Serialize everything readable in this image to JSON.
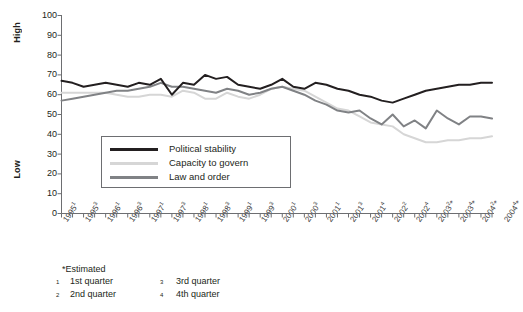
{
  "chart_data": {
    "type": "line",
    "title": "",
    "xlabel": "",
    "ylabel": "",
    "ylim": [
      0,
      100
    ],
    "ytick_values": [
      0,
      10,
      20,
      30,
      40,
      50,
      60,
      70,
      80,
      90,
      100
    ],
    "y_axis_high_label": "High",
    "y_axis_low_label": "Low",
    "grid": false,
    "legend_position": "inside-lower-left",
    "x": [
      "1995 Q1",
      "1995 Q2",
      "1995 Q3",
      "1995 Q4",
      "1996 Q1",
      "1996 Q2",
      "1996 Q3",
      "1996 Q4",
      "1997 Q1",
      "1997 Q2",
      "1997 Q3",
      "1997 Q4",
      "1998 Q1",
      "1998 Q2",
      "1998 Q3",
      "1998 Q4",
      "1999 Q1",
      "1999 Q2",
      "1999 Q3",
      "1999 Q4",
      "2000 Q1",
      "2000 Q2",
      "2000 Q3",
      "2000 Q4",
      "2001 Q1",
      "2001 Q2",
      "2001 Q3",
      "2001 Q4",
      "2002 Q1",
      "2002 Q2",
      "2002 Q3",
      "2002 Q4",
      "2003 Q1",
      "2003 Q2",
      "2003 Q3",
      "2003 Q4",
      "2004 Q1",
      "2004 Q2",
      "2004 Q3",
      "2004 Q4"
    ],
    "xtick_labels": [
      {
        "year": "1995",
        "sup": "1",
        "est": false
      },
      {
        "year": "1995",
        "sup": "3",
        "est": false
      },
      {
        "year": "1996",
        "sup": "1",
        "est": false
      },
      {
        "year": "1996",
        "sup": "3",
        "est": false
      },
      {
        "year": "1997",
        "sup": "1",
        "est": false
      },
      {
        "year": "1997",
        "sup": "3",
        "est": false
      },
      {
        "year": "1998",
        "sup": "1",
        "est": false
      },
      {
        "year": "1998",
        "sup": "3",
        "est": false
      },
      {
        "year": "1999",
        "sup": "1",
        "est": false
      },
      {
        "year": "1999",
        "sup": "3",
        "est": false
      },
      {
        "year": "2000",
        "sup": "1",
        "est": false
      },
      {
        "year": "2000",
        "sup": "3",
        "est": false
      },
      {
        "year": "2001",
        "sup": "1",
        "est": false
      },
      {
        "year": "2001",
        "sup": "3",
        "est": false
      },
      {
        "year": "2001",
        "sup": "4",
        "est": false
      },
      {
        "year": "2002",
        "sup": "2",
        "est": false
      },
      {
        "year": "2002",
        "sup": "4",
        "est": false
      },
      {
        "year": "2003",
        "sup": "2",
        "est": true
      },
      {
        "year": "2003",
        "sup": "4",
        "est": true
      },
      {
        "year": "2004",
        "sup": "2",
        "est": true
      },
      {
        "year": "2004",
        "sup": "4",
        "est": true
      }
    ],
    "series": [
      {
        "name": "Political stability",
        "color": "#231f20",
        "values": [
          67,
          66,
          64,
          65,
          66,
          65,
          64,
          66,
          65,
          68,
          60,
          66,
          65,
          70,
          68,
          69,
          65,
          64,
          63,
          65,
          68,
          64,
          63,
          66,
          65,
          63,
          62,
          60,
          59,
          57,
          56,
          58,
          60,
          62,
          63,
          64,
          65,
          65,
          66,
          66
        ]
      },
      {
        "name": "Capacity to govern",
        "color": "#d6d6d6",
        "values": [
          61,
          61,
          61,
          61,
          61,
          60,
          59,
          59,
          60,
          60,
          59,
          62,
          61,
          58,
          58,
          61,
          59,
          58,
          60,
          63,
          64,
          63,
          62,
          59,
          56,
          53,
          52,
          49,
          46,
          45,
          44,
          40,
          38,
          36,
          36,
          37,
          37,
          38,
          38,
          39
        ]
      },
      {
        "name": "Law and order",
        "color": "#808285",
        "values": [
          57,
          58,
          59,
          60,
          61,
          62,
          62,
          63,
          64,
          66,
          64,
          64,
          63,
          62,
          61,
          63,
          62,
          60,
          61,
          63,
          64,
          62,
          60,
          57,
          55,
          52,
          51,
          52,
          48,
          45,
          50,
          44,
          47,
          43,
          52,
          48,
          45,
          49,
          49,
          48
        ]
      }
    ]
  },
  "legend": {
    "items": [
      {
        "label": "Political stability",
        "color": "#231f20"
      },
      {
        "label": "Capacity to govern",
        "color": "#d6d6d6"
      },
      {
        "label": "Law and order",
        "color": "#808285"
      }
    ]
  },
  "footnotes": {
    "estimated": "*Estimated",
    "entries": [
      {
        "sup": "1",
        "text": "1st quarter"
      },
      {
        "sup": "3",
        "text": "3rd quarter"
      },
      {
        "sup": "2",
        "text": "2nd quarter"
      },
      {
        "sup": "4",
        "text": "4th quarter"
      }
    ]
  }
}
